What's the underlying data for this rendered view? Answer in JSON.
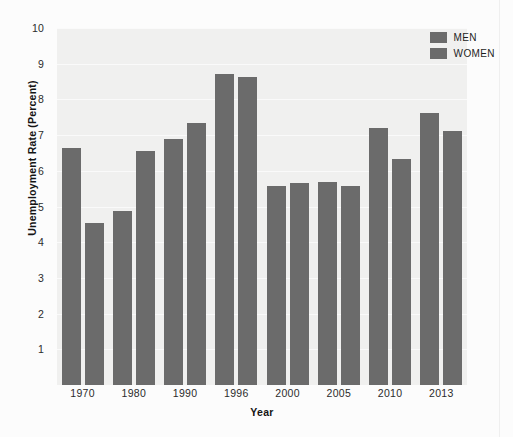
{
  "chart_data": {
    "type": "bar",
    "title": "",
    "xlabel": "Year",
    "ylabel": "Unemployment Rate (Percent)",
    "categories": [
      "1970",
      "1980",
      "1990",
      "1996",
      "2000",
      "2005",
      "2010",
      "2013"
    ],
    "series": [
      {
        "name": "MEN",
        "color": "#6b6b6b",
        "values": [
          6.65,
          4.87,
          6.88,
          8.72,
          5.58,
          5.68,
          7.2,
          7.63
        ]
      },
      {
        "name": "WOMEN",
        "color": "#6b6b6b",
        "values": [
          4.55,
          6.55,
          7.33,
          8.62,
          5.67,
          5.58,
          6.32,
          7.12
        ]
      }
    ],
    "ylim": [
      0,
      10
    ],
    "ytick_values": [
      10,
      9,
      8,
      7,
      6,
      5,
      4,
      3,
      2,
      1
    ],
    "ytick_labels": [
      "10",
      "9",
      "8",
      "7",
      "6",
      "5",
      "4",
      "3",
      "2",
      "1"
    ],
    "grid": true,
    "grid_axis": "y",
    "legend_position": "top-right"
  },
  "legend": {
    "items": [
      {
        "label": "MEN",
        "color": "#6b6b6b"
      },
      {
        "label": "WOMEN",
        "color": "#6b6b6b"
      }
    ]
  },
  "axes": {
    "y_title": "Unemployment Rate (Percent)",
    "x_title": "Year"
  },
  "margin_note": {
    "lines": [
      "",
      "",
      "",
      "",
      "",
      ""
    ]
  }
}
